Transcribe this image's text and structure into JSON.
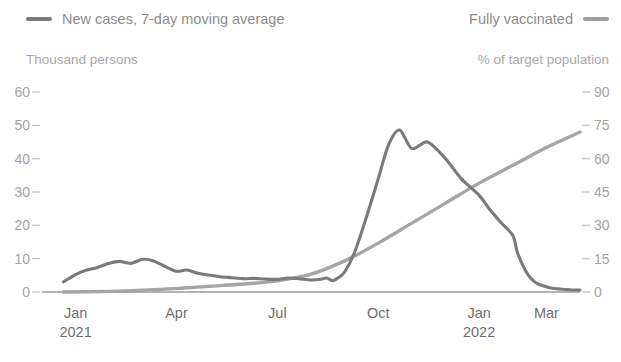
{
  "legend": {
    "left": {
      "label": "New cases, 7-day moving average",
      "swatch_name": "legend-swatch-new-cases",
      "color": "#7a7a7a"
    },
    "right": {
      "label": "Fully vaccinated",
      "swatch_name": "legend-swatch-fully-vaccinated",
      "color": "#9e9e9e"
    }
  },
  "axis_units": {
    "left": "Thousand persons",
    "right": "% of target population"
  },
  "chart_data": {
    "type": "line",
    "title": "",
    "subtitle": "",
    "xlabel": "",
    "ylabel": "Thousand persons",
    "y2label": "% of target population",
    "ylim": [
      0,
      60
    ],
    "y2lim": [
      0,
      90
    ],
    "grid": false,
    "legend_position": "top",
    "xtick_labels": [
      "Jan",
      "Apr",
      "Jul",
      "Oct",
      "Jan",
      "Mar"
    ],
    "xtick_years": [
      "2021",
      "",
      "",
      "",
      "2022",
      ""
    ],
    "xtick_months": [
      "2021-01",
      "2021-04",
      "2021-07",
      "2021-10",
      "2022-01",
      "2022-03"
    ],
    "ytick_labels_left": [
      "0",
      "10",
      "20",
      "30",
      "40",
      "50",
      "60"
    ],
    "ytick_values_left": [
      0,
      10,
      20,
      30,
      40,
      50,
      60
    ],
    "ytick_labels_right": [
      "0",
      "15",
      "30",
      "45",
      "60",
      "75",
      "90"
    ],
    "ytick_values_right": [
      0,
      15,
      30,
      45,
      60,
      75,
      90
    ],
    "x_range_months": [
      "2020-12",
      "2022-04"
    ],
    "series": [
      {
        "name": "New cases, 7-day moving average",
        "axis": "left",
        "color": "#7a7a7a",
        "unit": "thousand persons",
        "x": [
          "2020-12-20",
          "2021-01-01",
          "2021-01-10",
          "2021-01-20",
          "2021-02-01",
          "2021-02-10",
          "2021-02-20",
          "2021-03-01",
          "2021-03-10",
          "2021-03-20",
          "2021-04-01",
          "2021-04-10",
          "2021-04-20",
          "2021-05-01",
          "2021-05-10",
          "2021-05-20",
          "2021-06-01",
          "2021-06-10",
          "2021-06-20",
          "2021-07-01",
          "2021-07-10",
          "2021-07-20",
          "2021-08-01",
          "2021-08-10",
          "2021-08-15",
          "2021-08-20",
          "2021-08-25",
          "2021-09-01",
          "2021-09-10",
          "2021-09-20",
          "2021-10-01",
          "2021-10-10",
          "2021-10-20",
          "2021-11-01",
          "2021-11-15",
          "2021-12-01",
          "2021-12-15",
          "2022-01-01",
          "2022-01-10",
          "2022-01-20",
          "2022-02-01",
          "2022-02-05",
          "2022-02-10",
          "2022-02-15",
          "2022-02-20",
          "2022-02-25",
          "2022-03-01",
          "2022-03-05",
          "2022-03-10",
          "2022-03-15",
          "2022-03-20",
          "2022-03-25",
          "2022-03-31"
        ],
        "values": [
          3.0,
          5.2,
          6.5,
          7.3,
          8.6,
          9.2,
          8.6,
          9.8,
          9.4,
          7.8,
          6.2,
          6.6,
          5.6,
          5.0,
          4.6,
          4.3,
          4.0,
          4.1,
          3.9,
          3.8,
          4.2,
          4.0,
          3.6,
          3.8,
          4.2,
          3.4,
          4.2,
          6.0,
          12.0,
          22.0,
          34.0,
          44.0,
          48.6,
          43.0,
          45.0,
          40.0,
          34.0,
          29.0,
          25.0,
          21.0,
          17.0,
          12.0,
          8.0,
          5.0,
          3.2,
          2.2,
          1.6,
          1.2,
          1.0,
          0.8,
          0.7,
          0.6,
          0.6
        ],
        "peak_values": [
          9.8,
          48.6,
          53.8
        ],
        "peak_dates": [
          "2021-03-01",
          "2021-08-20",
          "2022-03-05"
        ]
      },
      {
        "name": "Fully vaccinated",
        "axis": "right",
        "color": "#a5a5a5",
        "unit": "% of target population",
        "x": [
          "2020-12-20",
          "2021-02-01",
          "2021-03-01",
          "2021-04-01",
          "2021-05-01",
          "2021-06-01",
          "2021-07-01",
          "2021-08-01",
          "2021-09-01",
          "2021-10-01",
          "2021-11-01",
          "2021-12-01",
          "2022-01-01",
          "2022-02-01",
          "2022-03-01",
          "2022-03-31"
        ],
        "values": [
          0.0,
          0.3,
          0.8,
          1.6,
          2.6,
          3.6,
          5.0,
          8.0,
          14.0,
          22.0,
          31.0,
          40.0,
          49.0,
          57.0,
          65.0,
          72.0
        ],
        "end_value": 72.0
      }
    ]
  }
}
